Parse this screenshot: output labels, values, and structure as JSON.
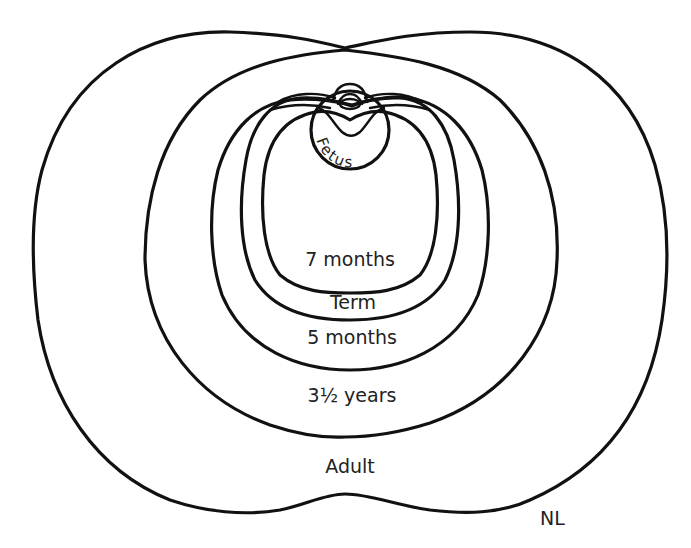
{
  "diagram": {
    "outlines": [
      {
        "id": "fetus",
        "label": "Fetus"
      },
      {
        "id": "seven_months",
        "label": "7 months"
      },
      {
        "id": "term",
        "label": "Term"
      },
      {
        "id": "five_months",
        "label": "5 months"
      },
      {
        "id": "three_half_years",
        "label": "3½ years"
      },
      {
        "id": "adult",
        "label": "Adult"
      }
    ],
    "corner_label": "NL",
    "line_color": "#111111",
    "background": "#ffffff"
  }
}
